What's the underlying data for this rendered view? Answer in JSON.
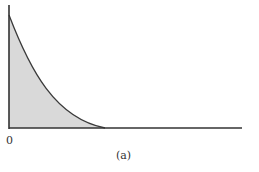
{
  "figure": {
    "origin_label": "0",
    "caption": "(a)"
  },
  "colors": {
    "axis": "#333333",
    "curve": "#3a3a3a",
    "fill": "#d9d9d9"
  },
  "curve": {
    "description": "decaying convex curve from top of vertical axis to horizontal axis, area under shaded",
    "start": [
      9,
      15
    ],
    "end": [
      105,
      128
    ]
  }
}
